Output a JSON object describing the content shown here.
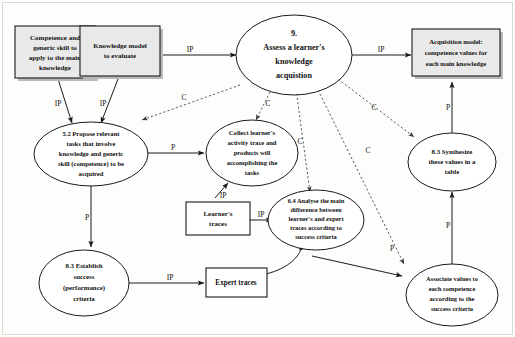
{
  "diagram": {
    "title": "9. Assess a learner's knowledge acquistion",
    "frame_color": "#d9d9d6",
    "box_fill": "#e9e9e9",
    "ellipse_fill": "#ffffff",
    "stroke_color": "#1a1a1a"
  },
  "nodes": {
    "competence_skill_box": {
      "kind": "box",
      "lines": [
        "Competence and",
        "generic skill to",
        "apply to the main",
        "knowledge"
      ]
    },
    "knowledge_model_box": {
      "kind": "box",
      "lines": [
        "Knowledge model",
        "to evaluate"
      ]
    },
    "acquisition_model_box": {
      "kind": "box",
      "lines": [
        "Acquisition model:",
        "competence values for",
        "each main knowledge"
      ]
    },
    "learners_traces_box": {
      "kind": "box",
      "lines": [
        "Learner's",
        "traces"
      ]
    },
    "expert_traces_box": {
      "kind": "box",
      "lines": [
        "Expert traces"
      ]
    },
    "assess_ellipse": {
      "kind": "ellipse",
      "lines": [
        "9.",
        "Assess a learner's",
        "knowledge",
        "acquistion"
      ]
    },
    "propose_tasks_ellipse": {
      "kind": "ellipse",
      "lines": [
        "5.2 Propose relevant",
        "tasks that involve",
        "knowledge and generic",
        "skill (competence) to be",
        "acquired"
      ]
    },
    "collect_trace_ellipse": {
      "kind": "ellipse",
      "lines": [
        "Collect learner's",
        "activity trace and",
        "products will",
        "accomplishing the",
        "tasks"
      ]
    },
    "analyse_difference_ellipse": {
      "kind": "ellipse",
      "lines": [
        "6.4 Analyse the main",
        "difference between",
        "learner's and expert",
        "traces according to",
        "success criteria"
      ]
    },
    "synthesize_values_ellipse": {
      "kind": "ellipse",
      "lines": [
        "8.3 Synthesize",
        "these values in a",
        "table"
      ]
    },
    "associate_values_ellipse": {
      "kind": "ellipse",
      "lines": [
        "Associate values to",
        "each competence",
        "according to the",
        "success criteria"
      ]
    },
    "establish_criteria_ellipse": {
      "kind": "ellipse",
      "lines": [
        "8.3 Establish",
        "success",
        "(performance)",
        "criteria"
      ]
    }
  },
  "edge_labels": {
    "knowledge_model_to_assess": "IP",
    "assess_to_acquisition_model": "IP",
    "competence_to_propose": "IP",
    "knowledge_model_to_propose": "IP",
    "propose_to_collect": "P",
    "propose_to_establish": "P",
    "establish_to_expert": "IP",
    "learners_traces_to_analyse": "IP",
    "collect_to_learners_traces": "IP",
    "expert_to_analyse": "IP",
    "analyse_to_associate": "P",
    "associate_to_synthesize": "P",
    "synthesize_to_acquisition": "P",
    "assess_to_propose": "C",
    "assess_to_collect": "C",
    "assess_to_analyse": "C",
    "assess_to_associate": "C",
    "assess_to_synthesize": "C"
  }
}
